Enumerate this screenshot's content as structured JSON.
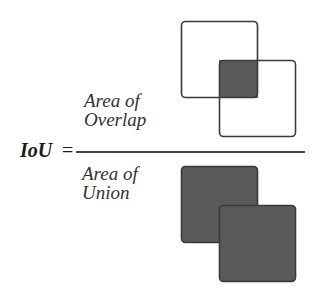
{
  "formula": {
    "lhs": "IoU",
    "equals": "=",
    "numerator": {
      "line1": "Area of",
      "line2": "Overlap"
    },
    "denominator": {
      "line1": "Area of",
      "line2": "Union"
    }
  },
  "colors": {
    "fill": "#5a5a5a",
    "stroke": "#3a3a3a",
    "text": "#333333"
  }
}
